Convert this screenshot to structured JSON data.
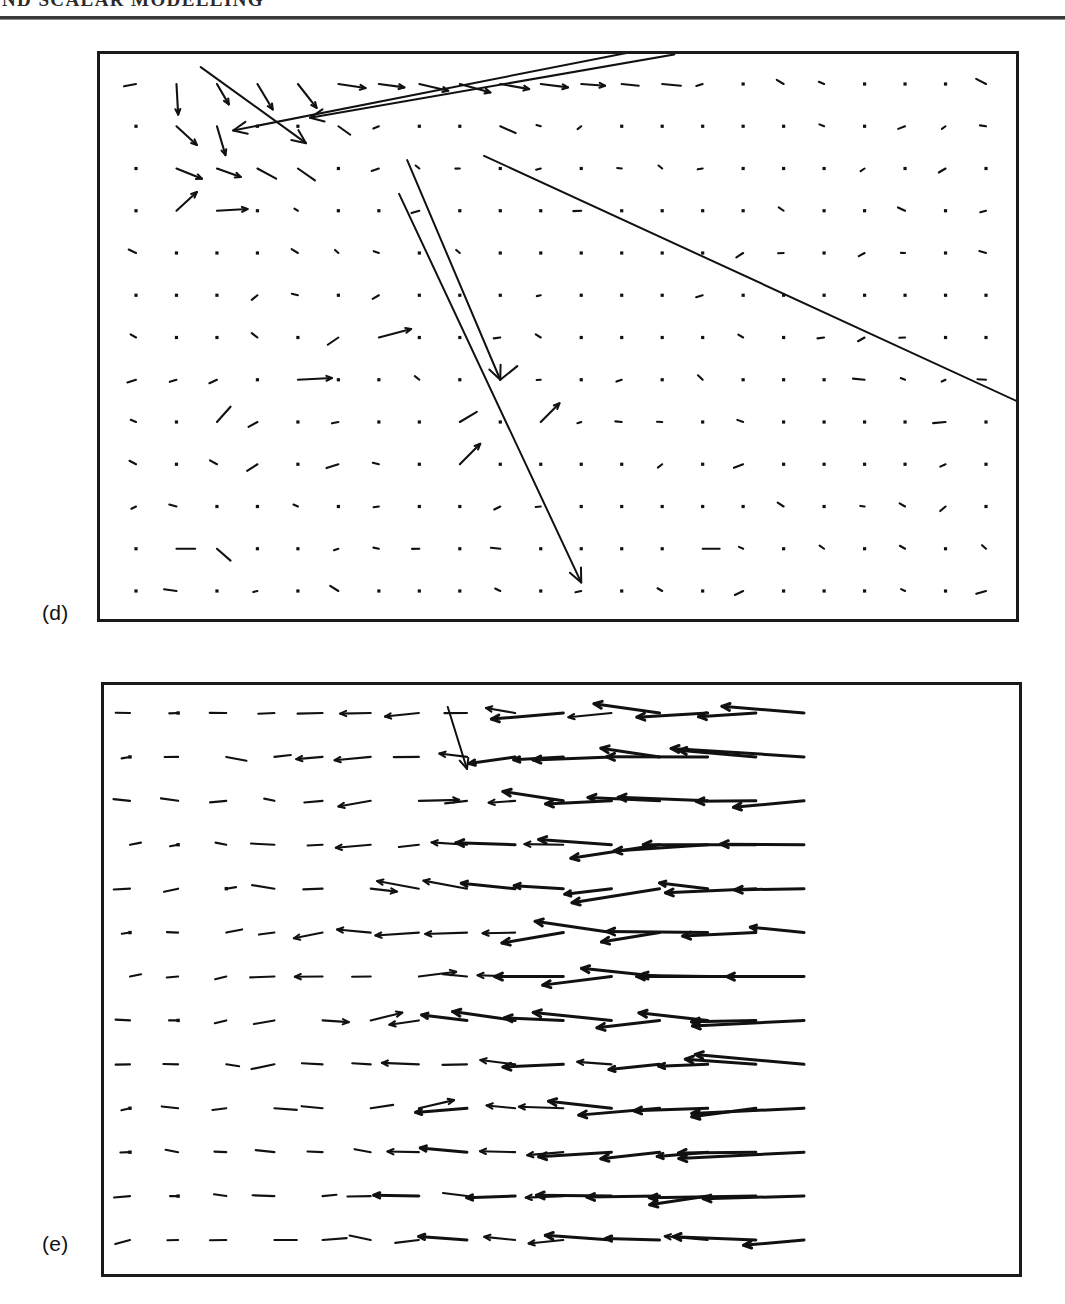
{
  "running_head": {
    "text": "ND SCALAR MODELLING"
  },
  "figure": {
    "panels": [
      {
        "id": "d",
        "label": "(d)"
      },
      {
        "id": "e",
        "label": "(e)"
      }
    ]
  },
  "chart_data": [
    {
      "type": "scatter",
      "plot_kind": "quiver-vector-field",
      "panel": "(d)",
      "title": "",
      "xlabel": "",
      "ylabel": "",
      "grid": false,
      "legend": null,
      "axis_ticks": [],
      "xlim": [
        0,
        22
      ],
      "ylim": [
        0,
        13
      ],
      "grid_nx": 22,
      "grid_ny": 13,
      "description": "Sparse vector field on a regular dot grid; most vectors are near zero (rendered as dots), a cluster of short vectors appears in the upper-left region, and several very long arrows cross the field.",
      "vectors": [
        {
          "x": 1,
          "y": 12,
          "u": 0.05,
          "v": -0.9
        },
        {
          "x": 2,
          "y": 12,
          "u": 0.35,
          "v": -0.6
        },
        {
          "x": 3,
          "y": 12,
          "u": 0.45,
          "v": -0.75
        },
        {
          "x": 4,
          "y": 12,
          "u": 0.55,
          "v": -0.7
        },
        {
          "x": 5,
          "y": 12,
          "u": 0.8,
          "v": -0.12
        },
        {
          "x": 6,
          "y": 12,
          "u": 0.75,
          "v": -0.1
        },
        {
          "x": 7,
          "y": 12,
          "u": 0.85,
          "v": -0.2
        },
        {
          "x": 8,
          "y": 12,
          "u": 0.9,
          "v": -0.25
        },
        {
          "x": 9,
          "y": 12,
          "u": 0.85,
          "v": -0.15
        },
        {
          "x": 10,
          "y": 12,
          "u": 0.8,
          "v": -0.1
        },
        {
          "x": 11,
          "y": 12,
          "u": 0.7,
          "v": -0.05
        },
        {
          "x": 12,
          "y": 12,
          "u": 0.5,
          "v": -0.05
        },
        {
          "x": 13,
          "y": 12,
          "u": 0.55,
          "v": -0.05
        },
        {
          "x": 1,
          "y": 11,
          "u": 0.6,
          "v": -0.55
        },
        {
          "x": 2,
          "y": 11,
          "u": 0.25,
          "v": -0.85
        },
        {
          "x": 5,
          "y": 11,
          "u": 0.35,
          "v": -0.25
        },
        {
          "x": 9,
          "y": 11,
          "u": 0.45,
          "v": -0.2
        },
        {
          "x": 1,
          "y": 10,
          "u": 0.75,
          "v": -0.3
        },
        {
          "x": 2,
          "y": 10,
          "u": 0.7,
          "v": -0.25
        },
        {
          "x": 3,
          "y": 10,
          "u": 0.55,
          "v": -0.3
        },
        {
          "x": 4,
          "y": 10,
          "u": 0.5,
          "v": -0.35
        },
        {
          "x": 1,
          "y": 9,
          "u": 0.6,
          "v": 0.55
        },
        {
          "x": 2,
          "y": 9,
          "u": 0.9,
          "v": 0.05
        },
        {
          "x": 6,
          "y": 6,
          "u": 0.95,
          "v": 0.25
        },
        {
          "x": 4,
          "y": 5,
          "u": 1.0,
          "v": 0.05
        },
        {
          "x": 9,
          "y": 5,
          "u": 0.5,
          "v": 0.4
        },
        {
          "x": 2,
          "y": 4,
          "u": 0.4,
          "v": 0.45
        },
        {
          "x": 8,
          "y": 4,
          "u": 0.5,
          "v": 0.3
        },
        {
          "x": 10,
          "y": 4,
          "u": 0.55,
          "v": 0.55
        },
        {
          "x": 8,
          "y": 3,
          "u": 0.6,
          "v": 0.6
        },
        {
          "x": 1,
          "y": 1,
          "u": 0.55,
          "v": 0.0
        },
        {
          "x": 2,
          "y": 1,
          "u": 0.4,
          "v": -0.35
        },
        {
          "x": 14,
          "y": 1,
          "u": 0.5,
          "v": 0.0
        }
      ],
      "long_arrows": [
        {
          "from": [
            1.6,
            12.4
          ],
          "to": [
            4.2,
            10.6
          ],
          "note": "down-right long arrow, upper left"
        },
        {
          "from": [
            13.0,
            12.9
          ],
          "to": [
            2.4,
            10.9
          ],
          "note": "long shallow arrow toward lower-left"
        },
        {
          "from": [
            13.3,
            12.7
          ],
          "to": [
            4.3,
            11.2
          ],
          "note": "second shallow parallel arrow"
        },
        {
          "from": [
            8.6,
            10.3
          ],
          "to": [
            22.2,
            4.3
          ],
          "note": "very long arrow to right edge, bends down"
        },
        {
          "from": [
            6.7,
            10.2
          ],
          "to": [
            9.0,
            5.0
          ],
          "note": "long steep downward arrow"
        },
        {
          "from": [
            6.5,
            9.4
          ],
          "to": [
            11.0,
            0.2
          ],
          "note": "longest steep arrow to bottom"
        }
      ]
    },
    {
      "type": "scatter",
      "plot_kind": "quiver-vector-field",
      "panel": "(e)",
      "title": "",
      "xlabel": "",
      "ylabel": "",
      "grid": false,
      "legend": null,
      "axis_ticks": [],
      "xlim": [
        0,
        22
      ],
      "ylim": [
        0,
        13
      ],
      "grid_nx": 22,
      "grid_ny": 13,
      "description": "Dense vector field; vectors are predominantly horizontal and point to the left (negative u). Magnitudes increase markedly toward the right half of the domain where long overlapping leftward arrows dominate. Left third shows shorter, mildly tilted vectors.",
      "dominant_direction": "leftward (-x)",
      "rows": 13,
      "cols": 15
    }
  ]
}
